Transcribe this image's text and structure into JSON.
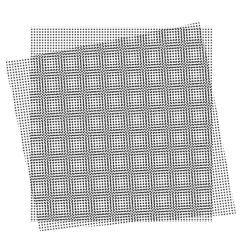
{
  "figure": {
    "width": 242,
    "height": 246,
    "background_color": "#ffffff",
    "dot_color": "#1a1a1a",
    "supersample": 3
  },
  "layers": [
    {
      "name": "base-dot-grid",
      "description": "Axis-aligned square lattice of dots",
      "rotation_deg": 0,
      "pitch_px": 2.72,
      "dot_radius_px": 0.72,
      "color": "#1a1a1a",
      "opacity": 1.0,
      "quad": [
        {
          "x": 30.0,
          "y": 27.0
        },
        {
          "x": 213.0,
          "y": 27.0
        },
        {
          "x": 213.0,
          "y": 222.0
        },
        {
          "x": 30.0,
          "y": 222.0
        }
      ]
    },
    {
      "name": "rotated-dot-grid",
      "description": "Same square lattice rotated slightly, producing moire beats",
      "rotation_deg": -7.6,
      "pitch_px": 2.72,
      "dot_radius_px": 0.72,
      "color": "#1a1a1a",
      "opacity": 1.0,
      "quad": [
        {
          "x": 5.0,
          "y": 62.0
        },
        {
          "x": 200.0,
          "y": 22.0
        },
        {
          "x": 236.0,
          "y": 214.0
        },
        {
          "x": 40.0,
          "y": 231.0
        }
      ]
    }
  ],
  "moire": {
    "beat_spacing_px": 20.5,
    "beat_angle_deg": -3.8,
    "visible_rosette_count_x": 9,
    "visible_rosette_count_y": 10
  }
}
